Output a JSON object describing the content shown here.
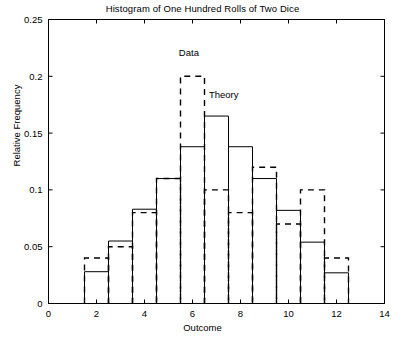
{
  "chart_data": {
    "type": "bar",
    "title": "Histogram of One Hundred Rolls of Two Dice",
    "xlabel": "Outcome",
    "ylabel": "Relative Frequency",
    "xlim": [
      0,
      14
    ],
    "ylim": [
      0,
      0.25
    ],
    "xticks": [
      "0",
      "2",
      "4",
      "6",
      "8",
      "10",
      "12",
      "14"
    ],
    "xtick_values": [
      0,
      2,
      4,
      6,
      8,
      10,
      12,
      14
    ],
    "yticks": [
      "0",
      "0.05",
      "0.1",
      "0.15",
      "0.2",
      "0.25"
    ],
    "ytick_values": [
      0,
      0.05,
      0.1,
      0.15,
      0.2,
      0.25
    ],
    "grid": false,
    "legend_position": "inline-annotations",
    "categories": [
      2,
      3,
      4,
      5,
      6,
      7,
      8,
      9,
      10,
      11,
      12
    ],
    "bar_width": 1.0,
    "series": [
      {
        "name": "Theory",
        "style": "solid",
        "color": "#000000",
        "values": [
          0.028,
          0.055,
          0.083,
          0.11,
          0.138,
          0.165,
          0.138,
          0.11,
          0.082,
          0.054,
          0.027
        ]
      },
      {
        "name": "Data",
        "style": "dashed",
        "color": "#000000",
        "values": [
          0.04,
          0.05,
          0.08,
          0.11,
          0.2,
          0.1,
          0.08,
          0.12,
          0.07,
          0.1,
          0.04
        ]
      }
    ],
    "annotations": [
      {
        "text": "Data",
        "x": 5.85,
        "y": 0.218
      },
      {
        "text": "Theory",
        "x": 7.3,
        "y": 0.181
      }
    ]
  }
}
